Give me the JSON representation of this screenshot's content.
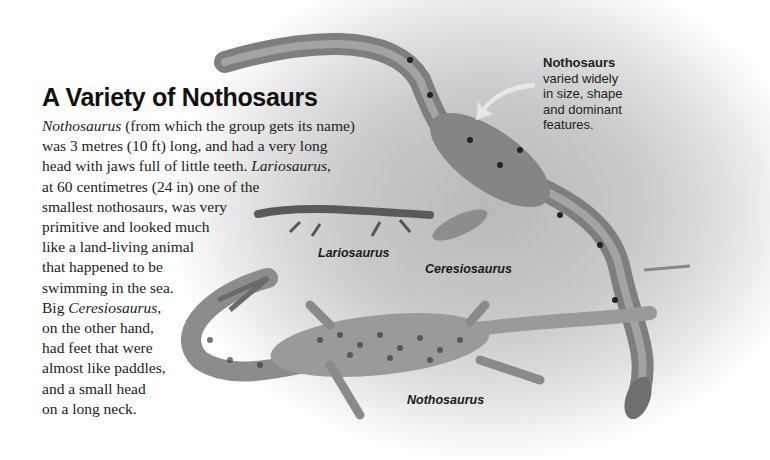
{
  "article": {
    "title": "A Variety of Nothosaurs",
    "body_lines": [
      [
        {
          "t": "Nothosaurus",
          "i": true
        },
        {
          "t": " (from which the group gets its name)"
        }
      ],
      [
        {
          "t": "was 3 metres (10 ft) long, and had a very long"
        }
      ],
      [
        {
          "t": "head with jaws full of little teeth. "
        },
        {
          "t": "Lariosaurus",
          "i": true
        },
        {
          "t": ","
        }
      ],
      [
        {
          "t": "at 60 centimetres (24 in) one of the"
        }
      ],
      [
        {
          "t": "smallest nothosaurs, was very"
        }
      ],
      [
        {
          "t": "primitive and looked much"
        }
      ],
      [
        {
          "t": "like a land-living animal"
        }
      ],
      [
        {
          "t": "that happened to be"
        }
      ],
      [
        {
          "t": "swimming in the sea."
        }
      ],
      [
        {
          "t": "Big "
        },
        {
          "t": "Ceresiosaurus",
          "i": true
        },
        {
          "t": ","
        }
      ],
      [
        {
          "t": "on the other hand,"
        }
      ],
      [
        {
          "t": "had feet that were"
        }
      ],
      [
        {
          "t": "almost like paddles,"
        }
      ],
      [
        {
          "t": "and a small head"
        }
      ],
      [
        {
          "t": "on a long neck."
        }
      ]
    ]
  },
  "callout": {
    "heading": "Nothosaurs",
    "lines": [
      "varied widely",
      "in size, shape",
      "and dominant",
      "features."
    ],
    "arrow_icon": "curved-arrow-left-down"
  },
  "illustration": {
    "labels": {
      "lariosaurus": "Lariosaurus",
      "ceresiosaurus": "Ceresiosaurus",
      "nothosaurus": "Nothosaurus"
    },
    "colors": {
      "background": "#c4c4c4",
      "ceresiosaurus_skin": "#8a8a8a",
      "nothosaurus_skin": "#9a9a9a",
      "spots": "#2a2a2a"
    }
  }
}
